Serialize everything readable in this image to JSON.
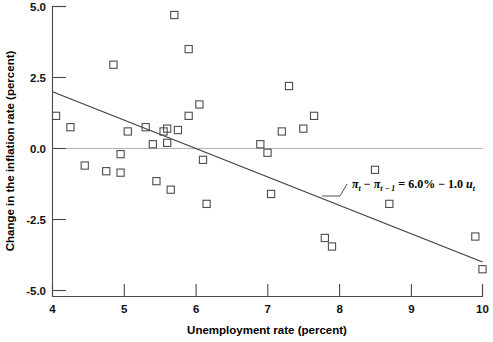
{
  "chart_data": {
    "type": "scatter",
    "title": "",
    "xlabel": "Unemployment rate (percent)",
    "ylabel": "Change in the inflation rate (percent)",
    "xlim": [
      4,
      10
    ],
    "ylim": [
      -5.0,
      5.0
    ],
    "xticks": [
      "4",
      "5",
      "6",
      "7",
      "8",
      "9",
      "10"
    ],
    "xtick_values": [
      4,
      5,
      6,
      7,
      8,
      9,
      10
    ],
    "yticks": [
      "5.0",
      "2.5",
      "0.0",
      "-2.5",
      "-5.0"
    ],
    "ytick_values": [
      5.0,
      2.5,
      0.0,
      -2.5,
      -5.0
    ],
    "grid": false,
    "legend": "none",
    "zero_reference_line": 0.0,
    "points": [
      {
        "x": 4.05,
        "y": 1.15
      },
      {
        "x": 4.25,
        "y": 0.75
      },
      {
        "x": 4.45,
        "y": -0.6
      },
      {
        "x": 4.85,
        "y": 2.95
      },
      {
        "x": 4.75,
        "y": -0.8
      },
      {
        "x": 4.95,
        "y": -0.85
      },
      {
        "x": 4.95,
        "y": -0.2
      },
      {
        "x": 5.05,
        "y": 0.6
      },
      {
        "x": 5.3,
        "y": 0.75
      },
      {
        "x": 5.4,
        "y": 0.15
      },
      {
        "x": 5.45,
        "y": -1.15
      },
      {
        "x": 5.55,
        "y": 0.6
      },
      {
        "x": 5.6,
        "y": 0.7
      },
      {
        "x": 5.6,
        "y": 0.2
      },
      {
        "x": 5.7,
        "y": 4.7
      },
      {
        "x": 5.65,
        "y": -1.45
      },
      {
        "x": 5.75,
        "y": 0.65
      },
      {
        "x": 5.9,
        "y": 3.5
      },
      {
        "x": 5.9,
        "y": 1.15
      },
      {
        "x": 6.05,
        "y": 1.55
      },
      {
        "x": 6.1,
        "y": -0.4
      },
      {
        "x": 6.15,
        "y": -1.95
      },
      {
        "x": 6.9,
        "y": 0.15
      },
      {
        "x": 7.0,
        "y": -0.15
      },
      {
        "x": 7.05,
        "y": -1.6
      },
      {
        "x": 7.2,
        "y": 0.6
      },
      {
        "x": 7.3,
        "y": 2.2
      },
      {
        "x": 7.5,
        "y": 0.7
      },
      {
        "x": 7.65,
        "y": 1.15
      },
      {
        "x": 7.8,
        "y": -3.15
      },
      {
        "x": 7.9,
        "y": -3.45
      },
      {
        "x": 8.5,
        "y": -0.75
      },
      {
        "x": 8.7,
        "y": -1.95
      },
      {
        "x": 9.9,
        "y": -3.1
      },
      {
        "x": 10.0,
        "y": -4.25
      }
    ],
    "fit_line": {
      "intercept_percent": 6.0,
      "slope": -1.0,
      "x_start": 4.0,
      "x_end": 10.0,
      "y_start": 2.0,
      "y_end": -4.0
    },
    "annotation": {
      "pi_symbol": "π",
      "minus": "−",
      "sub_t": "t",
      "sub_t_minus_1": "t − 1",
      "equals": "=",
      "intercept_text": "6.0%",
      "slope_text": "1.0",
      "u_symbol": "u",
      "full_text": "πt − πt−1 = 6.0% − 1.0 ut",
      "leader_line": true
    }
  },
  "axes": {
    "x_title": "Unemployment rate (percent)",
    "y_title": "Change in the inflation rate (percent)"
  },
  "colors": {
    "marker_stroke": "#4d4d4d",
    "axis": "#4a4a4a",
    "zero_line": "#b4b4b4",
    "fit_line": "#3c3c3c",
    "background": "#ffffff",
    "text": "#000000"
  }
}
